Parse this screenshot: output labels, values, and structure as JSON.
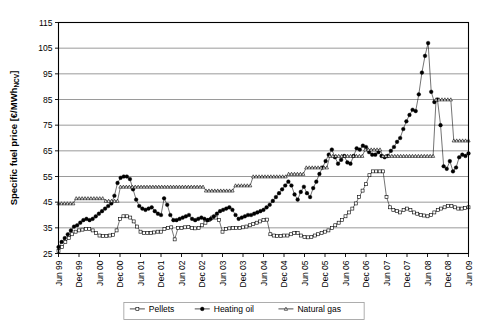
{
  "chart_data": {
    "type": "line",
    "title": "",
    "xlabel": "",
    "ylabel": "Specific fuel price [€/MWh",
    "ylabel_subscript": "NCV",
    "ylabel_suffix": "]",
    "ylim": [
      25,
      115
    ],
    "ytick_step": 10,
    "yticks": [
      25,
      35,
      45,
      55,
      65,
      75,
      85,
      95,
      105,
      115
    ],
    "grid": "horizontal",
    "legend_position": "bottom-center",
    "x_start": "Jun 99",
    "x_end": "Jun 09",
    "x_tick_interval_months": 6,
    "x_point_interval_months": 1,
    "xticks": [
      "Jun 99",
      "Dec 99",
      "Jun 00",
      "Dec 00",
      "Jun 01",
      "Dec 01",
      "Jun 02",
      "Dec 02",
      "Jun 03",
      "Dec 03",
      "Jun 04",
      "Dec 04",
      "Jun 05",
      "Dec 05",
      "Jun 06",
      "Dec 06",
      "Jun 07",
      "Dec 07",
      "Jun 08",
      "Dec 08",
      "Jun 09"
    ],
    "series": [
      {
        "name": "Pellets",
        "marker": "open-square",
        "values": [
          26.0,
          27.5,
          29.5,
          31.0,
          32.5,
          33.5,
          34.0,
          34.3,
          34.5,
          34.5,
          34.0,
          33.0,
          32.0,
          31.8,
          31.8,
          32.0,
          32.3,
          34.0,
          38.5,
          39.5,
          39.5,
          39.0,
          37.5,
          35.5,
          33.5,
          33.0,
          33.0,
          33.0,
          33.2,
          33.5,
          33.5,
          34.5,
          35.0,
          35.2,
          30.5,
          35.0,
          35.0,
          35.2,
          35.3,
          35.0,
          34.8,
          35.0,
          36.0,
          37.0,
          38.0,
          39.0,
          39.0,
          38.0,
          33.5,
          34.5,
          34.8,
          35.0,
          35.0,
          35.0,
          35.2,
          35.5,
          36.0,
          36.5,
          37.0,
          37.5,
          38.0,
          38.2,
          32.5,
          32.0,
          31.8,
          31.8,
          32.0,
          32.0,
          32.5,
          33.0,
          33.0,
          32.0,
          31.5,
          31.3,
          31.5,
          32.0,
          32.5,
          33.0,
          33.5,
          34.0,
          35.0,
          36.0,
          37.0,
          38.0,
          39.5,
          41.0,
          42.5,
          44.5,
          47.0,
          49.5,
          52.0,
          55.5,
          57.0,
          57.0,
          57.0,
          57.0,
          47.0,
          43.0,
          42.0,
          41.5,
          41.0,
          42.0,
          42.5,
          42.0,
          41.0,
          40.5,
          40.0,
          39.8,
          39.5,
          40.0,
          41.0,
          42.0,
          42.5,
          43.0,
          43.5,
          43.5,
          43.0,
          42.5,
          42.5,
          42.8,
          43.0
        ]
      },
      {
        "name": "Heating oil",
        "marker": "filled-circle",
        "values": [
          27.5,
          29.5,
          31.0,
          32.5,
          34.0,
          35.5,
          36.0,
          37.0,
          38.0,
          38.5,
          38.0,
          38.5,
          39.5,
          40.5,
          41.5,
          42.5,
          43.5,
          44.5,
          47.5,
          52.5,
          54.5,
          55.0,
          55.0,
          54.0,
          50.0,
          46.0,
          43.5,
          42.5,
          42.0,
          42.5,
          43.0,
          41.5,
          40.5,
          40.0,
          46.5,
          44.0,
          40.0,
          38.0,
          38.0,
          38.5,
          39.0,
          39.5,
          40.0,
          38.5,
          38.0,
          38.5,
          39.0,
          38.5,
          38.0,
          38.5,
          39.5,
          40.5,
          41.5,
          42.0,
          42.5,
          43.0,
          42.0,
          40.0,
          38.5,
          39.0,
          39.5,
          40.0,
          40.0,
          40.5,
          41.0,
          41.5,
          42.0,
          43.0,
          44.0,
          45.5,
          47.0,
          48.5,
          50.0,
          51.5,
          53.0,
          51.5,
          48.0,
          46.0,
          49.0,
          51.0,
          48.5,
          47.0,
          50.5,
          53.0,
          56.0,
          58.5,
          61.0,
          63.5,
          65.5,
          62.5,
          60.0,
          61.5,
          63.0,
          60.5,
          60.0,
          63.0,
          66.0,
          65.5,
          67.0,
          66.5,
          64.5,
          63.5,
          63.5,
          64.5,
          63.0,
          62.5,
          63.0,
          65.0,
          66.5,
          68.5,
          70.0,
          73.5,
          76.5,
          79.0,
          81.0,
          80.5,
          87.0,
          95.5,
          102.0,
          107.0,
          88.0,
          84.0,
          85.0,
          75.0,
          59.0,
          58.0,
          61.0,
          57.0,
          58.5,
          62.5,
          63.5,
          63.0,
          64.0
        ]
      },
      {
        "name": "Natural gas",
        "marker": "open-triangle",
        "values": [
          44.5,
          44.5,
          44.5,
          44.5,
          44.5,
          44.5,
          46.5,
          46.5,
          46.5,
          46.5,
          46.5,
          46.5,
          46.5,
          46.5,
          46.5,
          46.5,
          45.5,
          45.5,
          45.5,
          45.5,
          45.5,
          51.0,
          51.0,
          51.0,
          51.0,
          51.0,
          51.0,
          51.0,
          51.0,
          51.0,
          51.0,
          51.0,
          51.0,
          51.0,
          51.0,
          51.0,
          51.0,
          51.0,
          51.0,
          51.0,
          51.0,
          51.0,
          51.0,
          51.0,
          51.0,
          51.0,
          51.0,
          51.0,
          51.0,
          51.0,
          49.5,
          49.5,
          49.5,
          49.5,
          49.5,
          49.5,
          49.5,
          49.5,
          49.5,
          49.5,
          51.5,
          51.5,
          51.5,
          51.5,
          51.5,
          51.5,
          55.0,
          55.0,
          55.0,
          55.0,
          55.0,
          55.0,
          55.0,
          55.0,
          55.0,
          55.0,
          55.0,
          55.0,
          56.0,
          56.0,
          56.0,
          56.0,
          56.0,
          56.0,
          58.5,
          58.5,
          58.5,
          58.5,
          58.5,
          58.5,
          58.5,
          58.5,
          63.0,
          63.0,
          63.0,
          63.0,
          63.0,
          63.0,
          63.0,
          63.0,
          63.0,
          63.0,
          63.0,
          63.0,
          65.5,
          65.5,
          65.5,
          65.5,
          65.5,
          65.5,
          63.0,
          63.0,
          63.0,
          63.0,
          63.0,
          63.0,
          63.0,
          63.0,
          63.0,
          63.0,
          63.0,
          63.0,
          63.0,
          63.0,
          63.0,
          63.0,
          63.0,
          63.0,
          85.0,
          85.0,
          85.0,
          85.0,
          85.0,
          85.0,
          69.0,
          69.0,
          69.0,
          69.0,
          69.0,
          69.0
        ]
      }
    ]
  },
  "legend": {
    "items": [
      {
        "label": "Pellets",
        "marker": "open-square"
      },
      {
        "label": "Heating oil",
        "marker": "filled-circle"
      },
      {
        "label": "Natural gas",
        "marker": "open-triangle"
      }
    ]
  }
}
